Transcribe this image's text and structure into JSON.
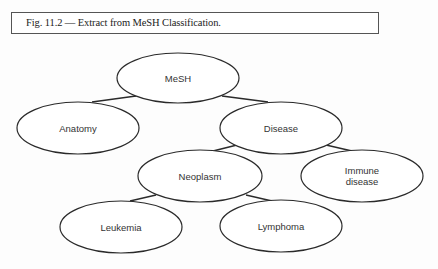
{
  "caption": {
    "text": "Fig. 11.2 — Extract from MeSH Classification."
  },
  "tree": {
    "nodes": [
      {
        "id": "mesh",
        "label_lines": [
          "MeSH"
        ],
        "cx": 178,
        "cy": 78,
        "rx": 61,
        "ry": 25
      },
      {
        "id": "anatomy",
        "label_lines": [
          "Anatomy"
        ],
        "cx": 78,
        "cy": 128,
        "rx": 61,
        "ry": 26
      },
      {
        "id": "disease",
        "label_lines": [
          "Disease"
        ],
        "cx": 281,
        "cy": 128,
        "rx": 61,
        "ry": 26
      },
      {
        "id": "neoplasm",
        "label_lines": [
          "Neoplasm"
        ],
        "cx": 200,
        "cy": 176,
        "rx": 62,
        "ry": 26
      },
      {
        "id": "immune-disease",
        "label_lines": [
          "Immune",
          "disease"
        ],
        "cx": 362,
        "cy": 176,
        "rx": 61,
        "ry": 26
      },
      {
        "id": "leukemia",
        "label_lines": [
          "Leukemia"
        ],
        "cx": 121,
        "cy": 227,
        "rx": 61,
        "ry": 26
      },
      {
        "id": "lymphoma",
        "label_lines": [
          "Lymphoma"
        ],
        "cx": 281,
        "cy": 226,
        "rx": 61,
        "ry": 26
      }
    ],
    "edges": [
      {
        "from": "mesh",
        "to": "anatomy",
        "x1": 136,
        "y1": 96,
        "x2": 92,
        "y2": 102
      },
      {
        "from": "mesh",
        "to": "disease",
        "x1": 222,
        "y1": 96,
        "x2": 268,
        "y2": 102
      },
      {
        "from": "disease",
        "to": "neoplasm",
        "x1": 237,
        "y1": 145,
        "x2": 213,
        "y2": 151
      },
      {
        "from": "disease",
        "to": "immune-disease",
        "x1": 326,
        "y1": 145,
        "x2": 352,
        "y2": 151
      },
      {
        "from": "neoplasm",
        "to": "leukemia",
        "x1": 156,
        "y1": 195,
        "x2": 130,
        "y2": 201
      },
      {
        "from": "neoplasm",
        "to": "lymphoma",
        "x1": 246,
        "y1": 195,
        "x2": 272,
        "y2": 201
      }
    ]
  }
}
